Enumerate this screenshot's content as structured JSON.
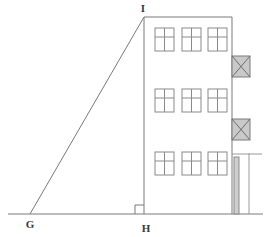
{
  "figure": {
    "background_color": "#ffffff",
    "line_color": "#7a7a7a",
    "label_color": "#3a3a3a",
    "hatch_fill_color": "#bdbdbd",
    "pipe_fill_color": "#cfcfcf",
    "vertices": [
      {
        "name": "G",
        "label": "G",
        "x": 30,
        "y": 214,
        "label_x": 30,
        "label_y": 228
      },
      {
        "name": "H",
        "label": "H",
        "x": 144,
        "y": 214,
        "label_x": 146,
        "label_y": 232
      },
      {
        "name": "I",
        "label": "I",
        "x": 144,
        "y": 17,
        "label_x": 143,
        "label_y": 12
      }
    ],
    "right_angle": {
      "at": "H",
      "size": 9
    },
    "baseline": {
      "x1": 8,
      "y1": 214,
      "x2": 263,
      "y2": 214
    },
    "hypotenuse": {
      "x1": 30,
      "y1": 214,
      "x2": 144,
      "y2": 17
    },
    "building": {
      "left": 144,
      "right": 232,
      "top": 17,
      "bottom": 214,
      "floors": [
        {
          "name": "top-floor",
          "window_y": 28,
          "window_h": 23
        },
        {
          "name": "middle-floor",
          "window_y": 89,
          "window_h": 23
        },
        {
          "name": "bottom-floor",
          "window_y": 152,
          "window_h": 23
        }
      ],
      "window_xs": [
        155,
        182,
        208
      ],
      "window_w": 19,
      "window_mullion_row_offset": 9
    },
    "braced_boxes": [
      {
        "name": "upper-brace-box",
        "x": 232,
        "y": 56,
        "w": 18,
        "h": 21
      },
      {
        "name": "lower-brace-box",
        "x": 232,
        "y": 119,
        "w": 18,
        "h": 21
      }
    ],
    "downspout": {
      "x": 234,
      "y": 157,
      "w": 5,
      "h": 57
    },
    "right_guide_line": {
      "x": 249,
      "y1": 153,
      "y2": 214
    },
    "cap_line": {
      "x1": 232,
      "y1": 154,
      "x2": 262,
      "y2": 154
    }
  }
}
